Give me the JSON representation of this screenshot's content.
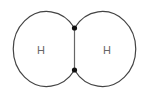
{
  "diagram": {
    "atoms": [
      {
        "symbol": "H"
      },
      {
        "symbol": "H"
      }
    ],
    "shared_electrons": 2,
    "colors": {
      "outline": "#444444",
      "bond_line": "#666666",
      "electron": "#111111",
      "label": "#666666"
    }
  }
}
